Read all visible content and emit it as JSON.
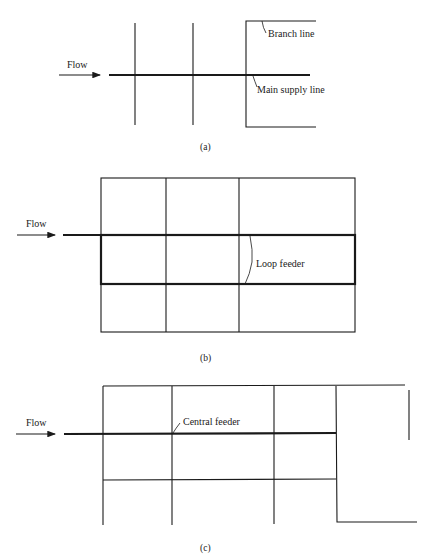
{
  "figure": {
    "panel_a": {
      "caption": "(a)",
      "flow_label": "Flow",
      "labels": {
        "branch": "Branch line",
        "main": "Main supply line"
      }
    },
    "panel_b": {
      "caption": "(b)",
      "flow_label": "Flow",
      "labels": {
        "loop": "Loop feeder"
      }
    },
    "panel_c": {
      "caption": "(c)",
      "flow_label": "Flow",
      "labels": {
        "central": "Central feeder"
      }
    }
  }
}
